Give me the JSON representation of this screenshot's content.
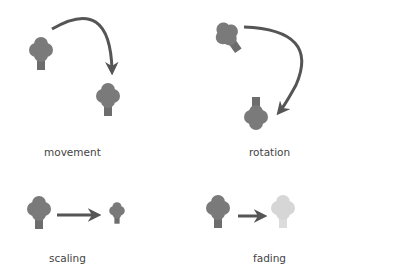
{
  "panels": [
    {
      "id": "movement",
      "label": "movement"
    },
    {
      "id": "rotation",
      "label": "rotation"
    },
    {
      "id": "scaling",
      "label": "scaling"
    },
    {
      "id": "fading",
      "label": "fading"
    }
  ],
  "colors": {
    "tree": "#7a7a7a",
    "tree_faded": "#d6d6d6",
    "arrow": "#555555",
    "text": "#444444"
  }
}
